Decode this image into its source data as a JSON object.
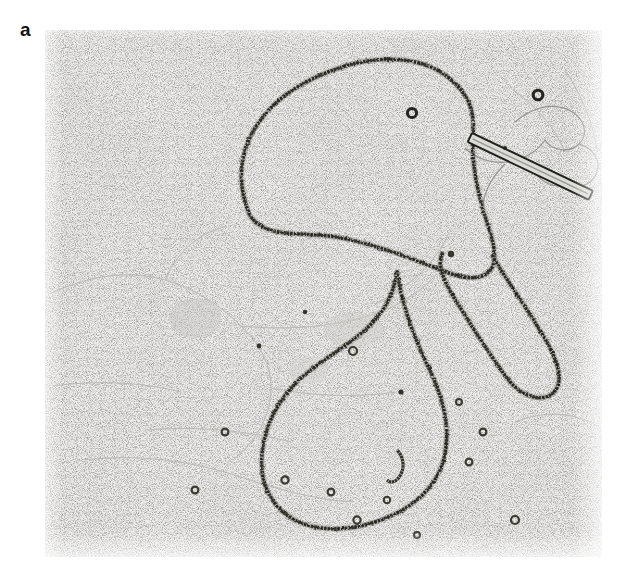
{
  "figure": {
    "panel_label": "a",
    "type": "transmission-electron-micrograph",
    "caption": "",
    "background_color": "#efeeec",
    "stain_color": "#3a3a38",
    "image_box": {
      "x": 45,
      "y": 30,
      "width": 557,
      "height": 527
    }
  },
  "micrograph": {
    "description": "Rotary-shadowed / stained electron micrograph of a large relaxed circular DNA-protein filament forming two lobes and a narrow internal loop, with a rod-shaped length marker and scattered small rings on a granular support film.",
    "background": {
      "grain_color": "#6e6e6c",
      "grain_density": "high",
      "film_creases": true
    },
    "features": [
      {
        "name": "upper-loop",
        "kind": "beaded-filament-loop",
        "label": "large upper circular lobe"
      },
      {
        "name": "lower-loop",
        "kind": "beaded-filament-loop",
        "label": "large lower circular lobe"
      },
      {
        "name": "narrow-internal-loop",
        "kind": "beaded-filament-loop",
        "label": "elongated narrow loop at crossover"
      },
      {
        "name": "crossover-junction",
        "kind": "filament-crossing",
        "label": "strand crossover point"
      },
      {
        "name": "rod-marker",
        "kind": "rod-particle",
        "label": "rod-shaped reference particle"
      },
      {
        "name": "small-ring-upper",
        "kind": "small-circular-particle",
        "label": "small dark ring"
      },
      {
        "name": "small-ring-top-right",
        "kind": "small-circular-particle",
        "label": "small dark ring"
      },
      {
        "name": "hook-fragment",
        "kind": "short-filament-fragment",
        "label": "short hooked filament fragment"
      }
    ]
  },
  "colors": {
    "panel_label": "#111111",
    "page_background": "#ffffff",
    "film_background": "#efeeec",
    "filament": "#3a3a38",
    "crease": "#9a9a98"
  }
}
